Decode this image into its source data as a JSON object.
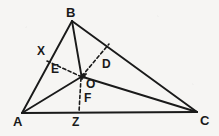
{
  "figure": {
    "background_color": "#f6f5f3",
    "ink_color": "#1a1a1a",
    "width": 219,
    "height": 136
  },
  "labels": {
    "A": "A",
    "B": "B",
    "C": "C",
    "D": "D",
    "E": "E",
    "F": "F",
    "O": "O",
    "X": "X",
    "Z": "Z"
  },
  "points": [
    {
      "name": "A",
      "label": "A",
      "x": 22,
      "y": 113,
      "label_x": 13,
      "label_y": 115,
      "size": "big"
    },
    {
      "name": "B",
      "label": "B",
      "x": 72,
      "y": 21,
      "label_x": 66,
      "label_y": 6,
      "size": "big"
    },
    {
      "name": "C",
      "label": "C",
      "x": 197,
      "y": 112,
      "label_x": 200,
      "label_y": 114,
      "size": "big"
    },
    {
      "name": "D",
      "label": "D",
      "x": 108,
      "y": 45,
      "label_x": 102,
      "label_y": 58,
      "size": "mid"
    },
    {
      "name": "E",
      "label": "E",
      "x": 62,
      "y": 71,
      "label_x": 51,
      "label_y": 63,
      "size": "mid"
    },
    {
      "name": "F",
      "label": "F",
      "x": 80,
      "y": 100,
      "label_x": 84,
      "label_y": 92,
      "size": "mid"
    },
    {
      "name": "O",
      "label": "O",
      "x": 83,
      "y": 76,
      "label_x": 86,
      "label_y": 78,
      "size": "mid"
    },
    {
      "name": "X",
      "label": "X",
      "x": 50,
      "y": 57,
      "label_x": 37,
      "label_y": 45,
      "size": "mid"
    },
    {
      "name": "Z",
      "label": "Z",
      "x": 79,
      "y": 112,
      "label_x": 72,
      "label_y": 116,
      "size": "mid"
    }
  ],
  "segments": [
    {
      "name": "side-AB",
      "from": "A",
      "to": "B",
      "style": "solid",
      "x1": 22,
      "y1": 113,
      "x2": 72,
      "y2": 21,
      "width": 1.9
    },
    {
      "name": "side-BC",
      "from": "B",
      "to": "C",
      "style": "solid",
      "x1": 72,
      "y1": 21,
      "x2": 197,
      "y2": 112,
      "width": 1.9
    },
    {
      "name": "side-AC",
      "from": "A",
      "to": "C",
      "style": "solid",
      "x1": 22,
      "y1": 113,
      "x2": 197,
      "y2": 112,
      "width": 2.2
    },
    {
      "name": "cevian-B-to-AC",
      "from": "B",
      "to": "F",
      "style": "solid",
      "x1": 72,
      "y1": 21,
      "x2": 82,
      "y2": 79,
      "width": 1.9
    },
    {
      "name": "cevian-A-to-O",
      "from": "A",
      "to": "O",
      "style": "solid",
      "x1": 22,
      "y1": 113,
      "x2": 86,
      "y2": 74,
      "width": 1.9
    },
    {
      "name": "cevian-O-to-C",
      "from": "O",
      "to": "C",
      "style": "solid",
      "x1": 83,
      "y1": 77,
      "x2": 197,
      "y2": 112,
      "width": 1.9
    },
    {
      "name": "dashed-X-to-O",
      "from": "X",
      "to": "O",
      "style": "dashed",
      "x1": 47,
      "y1": 61,
      "x2": 82,
      "y2": 77,
      "width": 1.6
    },
    {
      "name": "dashed-O-to-D",
      "from": "O",
      "to": "D",
      "style": "dashed",
      "x1": 82,
      "y1": 76,
      "x2": 109,
      "y2": 44,
      "width": 1.6
    },
    {
      "name": "dashed-O-to-Z",
      "from": "O",
      "to": "Z",
      "style": "dashed",
      "x1": 81,
      "y1": 78,
      "x2": 79,
      "y2": 112,
      "width": 1.6
    }
  ],
  "markers": [
    {
      "name": "intersection-point-O",
      "x": 83,
      "y": 76,
      "r": 2.6
    }
  ]
}
